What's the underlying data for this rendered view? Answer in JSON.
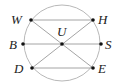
{
  "diagram": {
    "type": "geometry",
    "circle": {
      "cx": 62,
      "cy": 43,
      "r": 38,
      "stroke": "#b8b8b8"
    },
    "line_color": "#9a9a9a",
    "point_color": "#111111",
    "points": {
      "W": {
        "label": "W",
        "x": 31,
        "y": 20,
        "lx": 11,
        "ly": 24
      },
      "H": {
        "label": "H",
        "x": 93,
        "y": 20,
        "lx": 98,
        "ly": 24
      },
      "B": {
        "label": "B",
        "x": 23,
        "y": 44,
        "lx": 9,
        "ly": 49
      },
      "S": {
        "label": "S",
        "x": 101,
        "y": 44,
        "lx": 105,
        "ly": 49
      },
      "U": {
        "label": "U",
        "x": 62,
        "y": 44,
        "lx": 57,
        "ly": 36
      },
      "D": {
        "label": "D",
        "x": 32,
        "y": 68,
        "lx": 14,
        "ly": 73
      },
      "E": {
        "label": "E",
        "x": 93,
        "y": 68,
        "lx": 98,
        "ly": 73
      }
    },
    "segments": [
      [
        "W",
        "H"
      ],
      [
        "B",
        "S"
      ],
      [
        "D",
        "E"
      ],
      [
        "W",
        "E"
      ],
      [
        "D",
        "H"
      ]
    ]
  }
}
